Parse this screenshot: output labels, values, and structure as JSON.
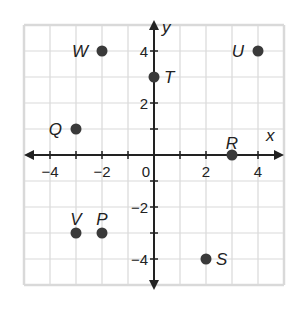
{
  "chart_data": {
    "type": "scatter",
    "title": "",
    "xlabel": "x",
    "ylabel": "y",
    "xlim": [
      -5,
      5
    ],
    "ylim": [
      -5,
      5
    ],
    "grid": true,
    "x_tick_labels": [
      "-4",
      "-2",
      "0",
      "2",
      "4"
    ],
    "y_tick_labels": [
      "4",
      "2",
      "-2",
      "-4"
    ],
    "points": [
      {
        "label": "W",
        "x": -2,
        "y": 4
      },
      {
        "label": "U",
        "x": 4,
        "y": 4
      },
      {
        "label": "T",
        "x": 0,
        "y": 3
      },
      {
        "label": "Q",
        "x": -3,
        "y": 1
      },
      {
        "label": "R",
        "x": 3,
        "y": 0
      },
      {
        "label": "V",
        "x": -3,
        "y": -3
      },
      {
        "label": "P",
        "x": -2,
        "y": -3
      },
      {
        "label": "S",
        "x": 2,
        "y": -4
      }
    ],
    "colors": {
      "grid": "#d9d9d9",
      "axis": "#222222",
      "point": "#3a3a3a"
    }
  }
}
